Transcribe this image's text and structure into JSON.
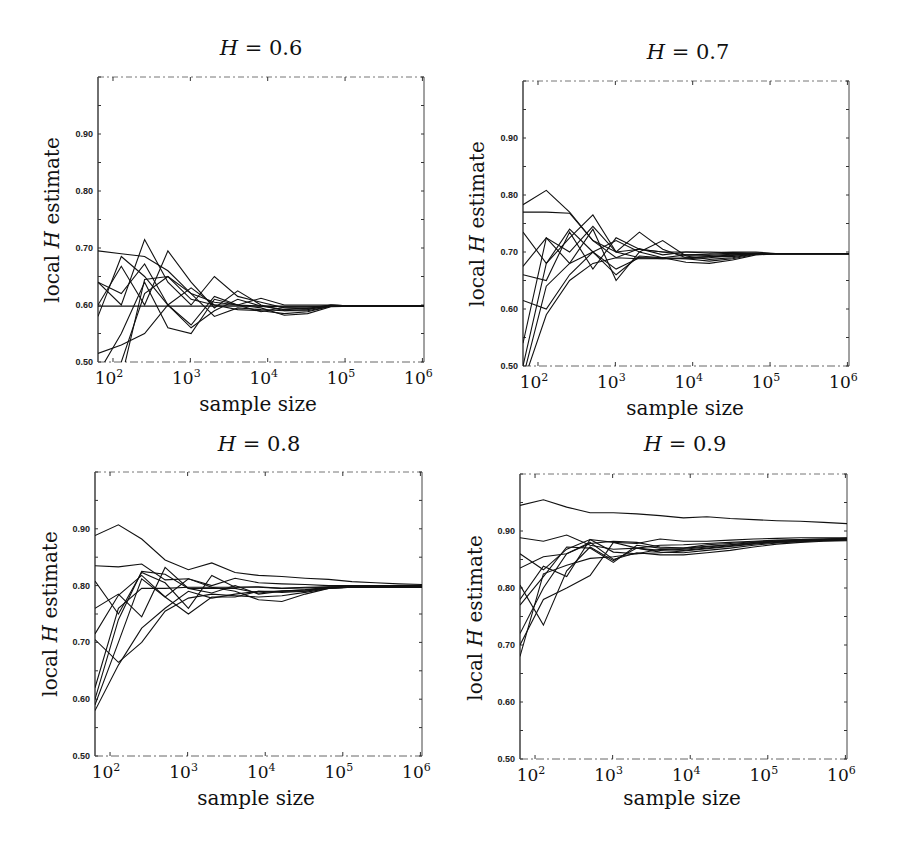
{
  "figure": {
    "ylabel_prefix": "local ",
    "ylabel_var": "H",
    "ylabel_suffix": " estimate",
    "xlabel": "sample size",
    "title_var": "H",
    "title_eq": " = "
  },
  "chart_data": [
    {
      "type": "line",
      "title": "H = 0.6",
      "title_value": "0.6",
      "xlabel": "sample size",
      "ylabel": "local H estimate",
      "xscale": "log",
      "xlim": [
        64,
        1048576
      ],
      "ylim": [
        0.5,
        1.0
      ],
      "xticks": [
        100,
        1000,
        10000,
        100000,
        1000000
      ],
      "xtick_labels": [
        "10^2",
        "10^3",
        "10^4",
        "10^5",
        "10^6"
      ],
      "yticks": [
        0.5,
        0.6,
        0.7,
        0.8,
        0.9
      ],
      "ytick_labels": [
        "0.50",
        "0.60",
        "0.70",
        "0.80",
        "0.90"
      ],
      "grid": false,
      "legend": null,
      "x": [
        64,
        128,
        256,
        512,
        1024,
        2048,
        4096,
        8192,
        16384,
        32768,
        65536,
        131072,
        262144,
        524288,
        1048576
      ],
      "series": [
        {
          "name": "run 1",
          "values": [
            0.695,
            0.69,
            0.685,
            0.66,
            0.62,
            0.605,
            0.6,
            0.598,
            0.597,
            0.597,
            0.598,
            0.598,
            0.598,
            0.598,
            0.598
          ]
        },
        {
          "name": "run 2",
          "values": [
            0.64,
            0.6,
            0.715,
            0.64,
            0.6,
            0.65,
            0.615,
            0.605,
            0.595,
            0.593,
            0.598,
            0.598,
            0.598,
            0.598,
            0.598
          ]
        },
        {
          "name": "run 3",
          "values": [
            0.6,
            0.668,
            0.6,
            0.695,
            0.64,
            0.595,
            0.625,
            0.6,
            0.59,
            0.592,
            0.6,
            0.598,
            0.598,
            0.598,
            0.598
          ]
        },
        {
          "name": "run 4",
          "values": [
            0.58,
            0.685,
            0.65,
            0.6,
            0.565,
            0.615,
            0.6,
            0.612,
            0.6,
            0.6,
            0.6,
            0.598,
            0.598,
            0.598,
            0.598
          ]
        },
        {
          "name": "run 5",
          "values": [
            0.598,
            0.598,
            0.598,
            0.598,
            0.598,
            0.598,
            0.598,
            0.598,
            0.598,
            0.598,
            0.598,
            0.598,
            0.598,
            0.598,
            0.598
          ]
        },
        {
          "name": "run 6",
          "values": [
            0.515,
            0.53,
            0.55,
            0.6,
            0.63,
            0.6,
            0.592,
            0.59,
            0.585,
            0.588,
            0.598,
            0.598,
            0.598,
            0.598,
            0.598
          ]
        },
        {
          "name": "run 7",
          "values": [
            0.48,
            0.55,
            0.64,
            0.56,
            0.55,
            0.61,
            0.6,
            0.595,
            0.582,
            0.585,
            0.597,
            0.598,
            0.598,
            0.598,
            0.598
          ]
        },
        {
          "name": "run 8",
          "values": [
            0.45,
            0.5,
            0.62,
            0.65,
            0.62,
            0.58,
            0.595,
            0.592,
            0.59,
            0.59,
            0.598,
            0.598,
            0.598,
            0.598,
            0.598
          ]
        },
        {
          "name": "run 9",
          "values": [
            0.47,
            0.47,
            0.645,
            0.65,
            0.61,
            0.6,
            0.6,
            0.588,
            0.596,
            0.596,
            0.598,
            0.598,
            0.598,
            0.598,
            0.598
          ]
        },
        {
          "name": "run 10",
          "values": [
            0.64,
            0.62,
            0.672,
            0.6,
            0.56,
            0.59,
            0.61,
            0.598,
            0.592,
            0.594,
            0.6,
            0.598,
            0.598,
            0.598,
            0.598
          ]
        }
      ]
    },
    {
      "type": "line",
      "title": "H = 0.7",
      "title_value": "0.7",
      "xlabel": "sample size",
      "ylabel": "local H estimate",
      "xscale": "log",
      "xlim": [
        64,
        1048576
      ],
      "ylim": [
        0.5,
        1.0
      ],
      "xticks": [
        100,
        1000,
        10000,
        100000,
        1000000
      ],
      "xtick_labels": [
        "10^2",
        "10^3",
        "10^4",
        "10^5",
        "10^6"
      ],
      "yticks": [
        0.5,
        0.6,
        0.7,
        0.8,
        0.9
      ],
      "ytick_labels": [
        "0.50",
        "0.60",
        "0.70",
        "0.80",
        "0.90"
      ],
      "grid": false,
      "legend": null,
      "x": [
        64,
        128,
        256,
        512,
        1024,
        2048,
        4096,
        8192,
        16384,
        32768,
        65536,
        131072,
        262144,
        524288,
        1048576
      ],
      "series": [
        {
          "name": "run 1",
          "values": [
            0.783,
            0.808,
            0.77,
            0.72,
            0.7,
            0.705,
            0.7,
            0.695,
            0.696,
            0.698,
            0.697,
            0.697,
            0.697,
            0.697,
            0.697
          ]
        },
        {
          "name": "run 2",
          "values": [
            0.77,
            0.77,
            0.768,
            0.72,
            0.69,
            0.706,
            0.695,
            0.7,
            0.7,
            0.699,
            0.698,
            0.697,
            0.697,
            0.697,
            0.697
          ]
        },
        {
          "name": "run 3",
          "values": [
            0.735,
            0.68,
            0.725,
            0.765,
            0.7,
            0.735,
            0.705,
            0.69,
            0.692,
            0.695,
            0.697,
            0.697,
            0.697,
            0.697,
            0.697
          ]
        },
        {
          "name": "run 4",
          "values": [
            0.675,
            0.725,
            0.68,
            0.74,
            0.65,
            0.7,
            0.72,
            0.693,
            0.687,
            0.69,
            0.697,
            0.697,
            0.697,
            0.697,
            0.697
          ]
        },
        {
          "name": "run 5",
          "values": [
            0.66,
            0.65,
            0.735,
            0.67,
            0.725,
            0.705,
            0.7,
            0.7,
            0.698,
            0.7,
            0.7,
            0.697,
            0.697,
            0.697,
            0.697
          ]
        },
        {
          "name": "run 6",
          "values": [
            0.615,
            0.6,
            0.66,
            0.7,
            0.72,
            0.7,
            0.69,
            0.688,
            0.684,
            0.688,
            0.696,
            0.697,
            0.697,
            0.697,
            0.697
          ]
        },
        {
          "name": "run 7",
          "values": [
            0.54,
            0.725,
            0.7,
            0.745,
            0.7,
            0.69,
            0.69,
            0.695,
            0.694,
            0.696,
            0.698,
            0.697,
            0.697,
            0.697,
            0.697
          ]
        },
        {
          "name": "run 8",
          "values": [
            0.5,
            0.68,
            0.74,
            0.7,
            0.66,
            0.693,
            0.69,
            0.682,
            0.68,
            0.686,
            0.695,
            0.697,
            0.697,
            0.697,
            0.697
          ]
        },
        {
          "name": "run 9",
          "values": [
            0.48,
            0.64,
            0.68,
            0.7,
            0.67,
            0.69,
            0.688,
            0.69,
            0.692,
            0.692,
            0.697,
            0.697,
            0.697,
            0.697,
            0.697
          ]
        },
        {
          "name": "run 10",
          "values": [
            0.47,
            0.59,
            0.65,
            0.68,
            0.69,
            0.688,
            0.688,
            0.688,
            0.69,
            0.694,
            0.697,
            0.697,
            0.697,
            0.697,
            0.697
          ]
        }
      ]
    },
    {
      "type": "line",
      "title": "H = 0.8",
      "title_value": "0.8",
      "xlabel": "sample size",
      "ylabel": "local H estimate",
      "xscale": "log",
      "xlim": [
        64,
        1048576
      ],
      "ylim": [
        0.5,
        1.0
      ],
      "xticks": [
        100,
        1000,
        10000,
        100000,
        1000000
      ],
      "xtick_labels": [
        "10^2",
        "10^3",
        "10^4",
        "10^5",
        "10^6"
      ],
      "yticks": [
        0.5,
        0.6,
        0.7,
        0.8,
        0.9
      ],
      "ytick_labels": [
        "0.50",
        "0.60",
        "0.70",
        "0.80",
        "0.90"
      ],
      "grid": false,
      "legend": null,
      "x": [
        64,
        128,
        256,
        512,
        1024,
        2048,
        4096,
        8192,
        16384,
        32768,
        65536,
        131072,
        262144,
        524288,
        1048576
      ],
      "series": [
        {
          "name": "run 1",
          "values": [
            0.888,
            0.907,
            0.882,
            0.845,
            0.828,
            0.84,
            0.823,
            0.818,
            0.816,
            0.813,
            0.811,
            0.807,
            0.805,
            0.803,
            0.802
          ]
        },
        {
          "name": "run 2",
          "values": [
            0.835,
            0.833,
            0.838,
            0.81,
            0.812,
            0.8,
            0.813,
            0.805,
            0.803,
            0.802,
            0.8,
            0.8,
            0.8,
            0.8,
            0.8
          ]
        },
        {
          "name": "run 3",
          "values": [
            0.808,
            0.75,
            0.823,
            0.805,
            0.76,
            0.818,
            0.797,
            0.798,
            0.795,
            0.797,
            0.798,
            0.799,
            0.799,
            0.799,
            0.799
          ]
        },
        {
          "name": "run 4",
          "values": [
            0.76,
            0.785,
            0.745,
            0.832,
            0.795,
            0.787,
            0.8,
            0.785,
            0.79,
            0.79,
            0.797,
            0.798,
            0.798,
            0.798,
            0.798
          ]
        },
        {
          "name": "run 5",
          "values": [
            0.715,
            0.783,
            0.818,
            0.78,
            0.812,
            0.797,
            0.79,
            0.775,
            0.772,
            0.785,
            0.795,
            0.797,
            0.797,
            0.797,
            0.797
          ]
        },
        {
          "name": "run 6",
          "values": [
            0.705,
            0.665,
            0.7,
            0.755,
            0.778,
            0.785,
            0.782,
            0.78,
            0.782,
            0.788,
            0.795,
            0.797,
            0.797,
            0.797,
            0.797
          ]
        },
        {
          "name": "run 7",
          "values": [
            0.6,
            0.74,
            0.825,
            0.82,
            0.795,
            0.795,
            0.795,
            0.787,
            0.791,
            0.792,
            0.796,
            0.797,
            0.797,
            0.797,
            0.797
          ]
        },
        {
          "name": "run 8",
          "values": [
            0.59,
            0.7,
            0.812,
            0.78,
            0.75,
            0.78,
            0.78,
            0.79,
            0.79,
            0.793,
            0.797,
            0.797,
            0.797,
            0.797,
            0.797
          ]
        },
        {
          "name": "run 9",
          "values": [
            0.58,
            0.66,
            0.725,
            0.76,
            0.79,
            0.778,
            0.785,
            0.79,
            0.788,
            0.79,
            0.796,
            0.797,
            0.797,
            0.797,
            0.797
          ]
        },
        {
          "name": "run 10",
          "values": [
            0.62,
            0.76,
            0.795,
            0.795,
            0.797,
            0.797,
            0.797,
            0.797,
            0.795,
            0.796,
            0.797,
            0.797,
            0.797,
            0.797,
            0.797
          ]
        }
      ]
    },
    {
      "type": "line",
      "title": "H = 0.9",
      "title_value": "0.9",
      "xlabel": "sample size",
      "ylabel": "local H estimate",
      "xscale": "log",
      "xlim": [
        64,
        1048576
      ],
      "ylim": [
        0.5,
        1.0
      ],
      "xticks": [
        100,
        1000,
        10000,
        100000,
        1000000
      ],
      "xtick_labels": [
        "10^2",
        "10^3",
        "10^4",
        "10^5",
        "10^6"
      ],
      "yticks": [
        0.5,
        0.6,
        0.7,
        0.8,
        0.9
      ],
      "ytick_labels": [
        "0.50",
        "0.60",
        "0.70",
        "0.80",
        "0.90"
      ],
      "grid": false,
      "legend": null,
      "x": [
        64,
        128,
        256,
        512,
        1024,
        2048,
        4096,
        8192,
        16384,
        32768,
        65536,
        131072,
        262144,
        524288,
        1048576
      ],
      "series": [
        {
          "name": "run 1",
          "values": [
            0.945,
            0.955,
            0.942,
            0.932,
            0.932,
            0.93,
            0.927,
            0.923,
            0.925,
            0.922,
            0.92,
            0.918,
            0.917,
            0.915,
            0.913
          ]
        },
        {
          "name": "run 2",
          "values": [
            0.888,
            0.882,
            0.893,
            0.875,
            0.868,
            0.87,
            0.875,
            0.876,
            0.878,
            0.88,
            0.882,
            0.884,
            0.885,
            0.886,
            0.887
          ]
        },
        {
          "name": "run 3",
          "values": [
            0.86,
            0.832,
            0.868,
            0.885,
            0.88,
            0.878,
            0.886,
            0.882,
            0.882,
            0.884,
            0.886,
            0.887,
            0.888,
            0.888,
            0.888
          ]
        },
        {
          "name": "run 4",
          "values": [
            0.835,
            0.855,
            0.86,
            0.878,
            0.882,
            0.88,
            0.872,
            0.87,
            0.876,
            0.878,
            0.881,
            0.883,
            0.885,
            0.886,
            0.887
          ]
        },
        {
          "name": "run 5",
          "values": [
            0.805,
            0.735,
            0.83,
            0.872,
            0.848,
            0.87,
            0.863,
            0.862,
            0.866,
            0.87,
            0.875,
            0.879,
            0.881,
            0.883,
            0.884
          ]
        },
        {
          "name": "run 6",
          "values": [
            0.78,
            0.838,
            0.82,
            0.885,
            0.863,
            0.86,
            0.868,
            0.866,
            0.87,
            0.874,
            0.878,
            0.881,
            0.883,
            0.884,
            0.885
          ]
        },
        {
          "name": "run 7",
          "values": [
            0.77,
            0.82,
            0.872,
            0.87,
            0.845,
            0.875,
            0.87,
            0.87,
            0.873,
            0.876,
            0.88,
            0.882,
            0.884,
            0.885,
            0.886
          ]
        },
        {
          "name": "run 8",
          "values": [
            0.72,
            0.8,
            0.86,
            0.88,
            0.85,
            0.862,
            0.858,
            0.858,
            0.862,
            0.866,
            0.872,
            0.877,
            0.88,
            0.882,
            0.883
          ]
        },
        {
          "name": "run 9",
          "values": [
            0.7,
            0.78,
            0.8,
            0.822,
            0.88,
            0.87,
            0.866,
            0.868,
            0.872,
            0.876,
            0.879,
            0.882,
            0.883,
            0.884,
            0.885
          ]
        },
        {
          "name": "run 10",
          "values": [
            0.68,
            0.825,
            0.84,
            0.852,
            0.855,
            0.86,
            0.862,
            0.865,
            0.869,
            0.873,
            0.877,
            0.88,
            0.882,
            0.884,
            0.885
          ]
        }
      ]
    }
  ]
}
